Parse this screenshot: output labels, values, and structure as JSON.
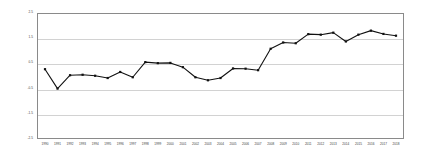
{
  "chart_data": {
    "type": "line",
    "title": "",
    "subtitle": "",
    "xlabel": "",
    "ylabel": "",
    "grid": true,
    "legend": false,
    "legend_position": "none",
    "line_color": "#111111",
    "marker_color": "#111111",
    "grid_color": "#d2d2d2",
    "frame_color": "#8a8a8a",
    "xlim": [
      1990,
      2018
    ],
    "ylim": [
      -2.5,
      2.5
    ],
    "yticks": [
      2.5,
      1.5,
      0.5,
      -0.5,
      -1.5,
      -2.5
    ],
    "ytick_labels": [
      "2.5",
      "1.5",
      "0.5",
      "-0.5",
      "-1.5",
      "-2.5"
    ],
    "categories": [
      "1990",
      "1991",
      "1992",
      "1993",
      "1994",
      "1995",
      "1996",
      "1997",
      "1998",
      "1999",
      "2000",
      "2001",
      "2002",
      "2003",
      "2004",
      "2005",
      "2006",
      "2007",
      "2008",
      "2009",
      "2010",
      "2011",
      "2012",
      "2013",
      "2014",
      "2015",
      "2016",
      "2017",
      "2018"
    ],
    "values": [
      0.27,
      -0.5,
      0.03,
      0.05,
      0.01,
      -0.08,
      0.16,
      -0.05,
      0.55,
      0.51,
      0.52,
      0.35,
      -0.05,
      -0.17,
      -0.08,
      0.3,
      0.29,
      0.23,
      1.08,
      1.33,
      1.3,
      1.66,
      1.64,
      1.72,
      1.37,
      1.64,
      1.8,
      1.67,
      1.6
    ],
    "series": [
      {
        "name": "series-1",
        "values": [
          0.27,
          -0.5,
          0.03,
          0.05,
          0.01,
          -0.08,
          0.16,
          -0.05,
          0.55,
          0.51,
          0.52,
          0.35,
          -0.05,
          -0.17,
          -0.08,
          0.3,
          0.29,
          0.23,
          1.08,
          1.33,
          1.3,
          1.66,
          1.64,
          1.72,
          1.37,
          1.64,
          1.8,
          1.67,
          1.6
        ]
      }
    ],
    "annotations": []
  }
}
